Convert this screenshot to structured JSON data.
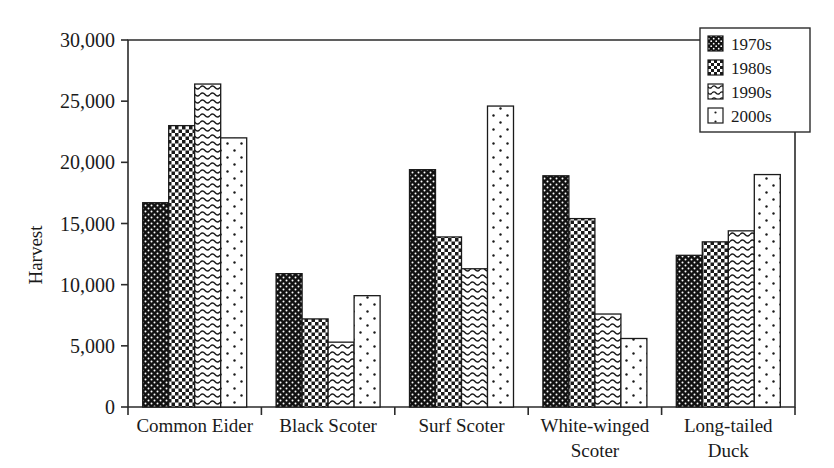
{
  "chart_data": {
    "type": "bar",
    "title": "",
    "xlabel": "",
    "ylabel": "Harvest",
    "ylim": [
      0,
      30000
    ],
    "ytick_values": [
      0,
      5000,
      10000,
      15000,
      20000,
      25000,
      30000
    ],
    "ytick_labels": [
      "0",
      "5,000",
      "10,000",
      "15,000",
      "20,000",
      "25,000",
      "30,000"
    ],
    "grid": false,
    "legend_position": "top-right",
    "categories": [
      "Common Eider",
      "Black Scoter",
      "Surf Scoter",
      "White-winged Scoter",
      "Long-tailed Duck"
    ],
    "category_lines": [
      [
        "Common Eider"
      ],
      [
        "Black Scoter"
      ],
      [
        "Surf Scoter"
      ],
      [
        "White-winged",
        "Scoter"
      ],
      [
        "Long-tailed",
        "Duck"
      ]
    ],
    "series": [
      {
        "name": "1970s",
        "pattern": "dark-dots",
        "values": [
          16700,
          10900,
          19400,
          18900,
          12400
        ]
      },
      {
        "name": "1980s",
        "pattern": "checkerboard",
        "values": [
          23000,
          7200,
          13900,
          15400,
          13500
        ]
      },
      {
        "name": "1990s",
        "pattern": "wavy",
        "values": [
          26400,
          5300,
          11300,
          7600,
          14400
        ]
      },
      {
        "name": "2000s",
        "pattern": "sparse-dots",
        "values": [
          22000,
          9100,
          24600,
          5600,
          19000
        ]
      }
    ]
  },
  "legend": {
    "entries": [
      {
        "label": "1970s",
        "swatch": "dark-dots-swatch"
      },
      {
        "label": "1980s",
        "swatch": "checkerboard-swatch"
      },
      {
        "label": "1990s",
        "swatch": "wavy-swatch"
      },
      {
        "label": "2000s",
        "swatch": "sparse-dots-swatch"
      }
    ]
  },
  "colors": {
    "ink": "#1a1a1a",
    "frame": "#2b2b2b",
    "background": "#ffffff",
    "fill_dark": "#111111",
    "fill_light": "#ffffff"
  }
}
